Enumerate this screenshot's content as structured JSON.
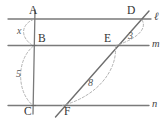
{
  "figure": {
    "colors": {
      "solid_line": "#7a7a7a",
      "dashed_arc": "#a9a9a9",
      "label_text": "#2b2b2b",
      "background": "#ffffff"
    },
    "lines": [
      {
        "name": "l",
        "label": "ℓ",
        "y": 19,
        "x1": 8,
        "x2": 151
      },
      {
        "name": "m",
        "label": "m",
        "y": 46,
        "x1": 8,
        "x2": 149
      },
      {
        "name": "n",
        "label": "n",
        "y": 106,
        "x1": 8,
        "x2": 149
      }
    ],
    "transversals": [
      {
        "name": "ABC",
        "points": [
          "A",
          "B",
          "C"
        ],
        "x_top": 35,
        "y_top": 10,
        "x_bottom": 33,
        "y_bottom": 114
      },
      {
        "name": "DEF",
        "points": [
          "D",
          "E",
          "F"
        ],
        "x_top": 148,
        "y_top": 11,
        "x_bottom": 56,
        "y_bottom": 116
      }
    ],
    "points": [
      {
        "label": "A",
        "x": 34,
        "y": 19
      },
      {
        "label": "B",
        "x": 34,
        "y": 46
      },
      {
        "label": "C",
        "x": 33,
        "y": 106
      },
      {
        "label": "D",
        "x": 143,
        "y": 19
      },
      {
        "label": "E",
        "x": 115,
        "y": 46
      },
      {
        "label": "F",
        "x": 62,
        "y": 106
      }
    ],
    "measurements": [
      {
        "label": "x",
        "segment": "AB",
        "from": "A",
        "to": "B",
        "side": "left"
      },
      {
        "label": "5",
        "segment": "BC",
        "from": "B",
        "to": "C",
        "side": "left"
      },
      {
        "label": "3",
        "segment": "DE",
        "from": "D",
        "to": "E",
        "side": "right"
      },
      {
        "label": "8",
        "segment": "EF",
        "from": "E",
        "to": "F",
        "side": "right"
      }
    ]
  }
}
